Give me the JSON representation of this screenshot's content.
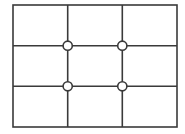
{
  "diagram": {
    "type": "rule-of-thirds-grid",
    "frame": {
      "x": 13,
      "y": 5,
      "width": 164,
      "height": 122
    },
    "vertical_lines_x": [
      67.7,
      122.3
    ],
    "horizontal_lines_y": [
      45.7,
      86.3
    ],
    "intersections": [
      {
        "cx": 67.7,
        "cy": 45.7
      },
      {
        "cx": 122.3,
        "cy": 45.7
      },
      {
        "cx": 67.7,
        "cy": 86.3
      },
      {
        "cx": 122.3,
        "cy": 86.3
      }
    ],
    "circle_radius": 4.6,
    "colors": {
      "line": "#3a3a3a",
      "background": "#ffffff",
      "circle_fill": "#ffffff"
    },
    "stroke_width": 1.6
  }
}
